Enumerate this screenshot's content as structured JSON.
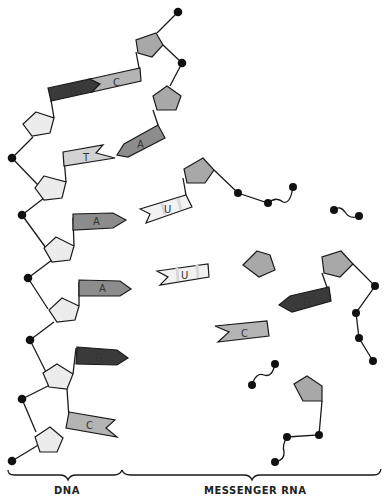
{
  "labels": {
    "dna": "DNA",
    "messenger_rna": "MESSENGER RNA"
  },
  "bases": {
    "top_g": "G",
    "top_c": "C",
    "t": "T",
    "a_pair": "A",
    "a1": "A",
    "u1": "U",
    "a2": "A",
    "u2": "U",
    "g_left": "G",
    "g_right": "G",
    "c_free": "C",
    "c_bottom": "C"
  },
  "colors": {
    "background": "#ffffff",
    "stroke": "#1a1a1a",
    "sugar_dna": "#ececec",
    "sugar_rna": "#a8a8a8",
    "guanine": "#3a3a3a",
    "adenine": "#8c8c8c",
    "cytosine": "#b4b4b4",
    "thymine": "#d2d2d2",
    "uracil": "#f2f2f2"
  }
}
